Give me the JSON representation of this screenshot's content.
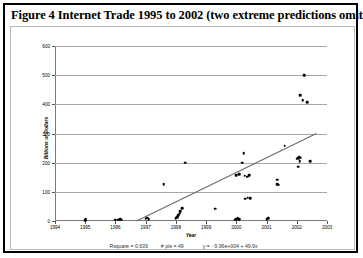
{
  "figure": {
    "title": "Figure 4 Internet Trade 1995 to 2002 (two extreme predictions omitted)"
  },
  "stats": {
    "rsquare_label": "Rsquare = 0.639",
    "npts_label": "# pts = 49",
    "equation_label": "y = - 9.96e+004 + 49.9x"
  },
  "chart_data": {
    "type": "scatter",
    "title": "Figure 4 Internet Trade 1995 to 2002 (two extreme predictions omitted)",
    "xlabel": "Year",
    "ylabel": "Billions of Dollars",
    "xlim": [
      1994,
      2003
    ],
    "ylim": [
      0,
      600
    ],
    "xticks": [
      1994,
      1995,
      1996,
      1997,
      1998,
      1999,
      2000,
      2001,
      2002,
      2003
    ],
    "xtick_labels": [
      "1994",
      "1995",
      "1996",
      "1997",
      "1998",
      "1999",
      "2000",
      "2001",
      "2002",
      "2003"
    ],
    "yticks": [
      0,
      100,
      200,
      300,
      400,
      500,
      600
    ],
    "ytick_labels": [
      "0",
      "100",
      "200",
      "300",
      "400",
      "500",
      "600"
    ],
    "grid": "horizontal",
    "legend": "none",
    "regression": {
      "rsquare": 0.639,
      "n_points": 49,
      "intercept": -99600,
      "slope": 49.9,
      "equation": "y = - 9.96e+004 + 49.9x",
      "line_x": [
        1996.7,
        2002.65
      ],
      "line_y": [
        0,
        300
      ]
    },
    "points": [
      {
        "x": 1995.0,
        "y": 3
      },
      {
        "x": 1995.02,
        "y": 6
      },
      {
        "x": 1996.0,
        "y": 4
      },
      {
        "x": 1996.1,
        "y": 5
      },
      {
        "x": 1996.15,
        "y": 7
      },
      {
        "x": 1996.2,
        "y": 4
      },
      {
        "x": 1997.0,
        "y": 8
      },
      {
        "x": 1997.05,
        "y": 12
      },
      {
        "x": 1997.1,
        "y": 6
      },
      {
        "x": 1997.6,
        "y": 126
      },
      {
        "x": 1998.0,
        "y": 9
      },
      {
        "x": 1998.05,
        "y": 14
      },
      {
        "x": 1998.08,
        "y": 20
      },
      {
        "x": 1998.12,
        "y": 26
      },
      {
        "x": 1998.15,
        "y": 33
      },
      {
        "x": 1998.2,
        "y": 43
      },
      {
        "x": 1998.3,
        "y": 200
      },
      {
        "x": 1999.3,
        "y": 42
      },
      {
        "x": 1999.95,
        "y": 5
      },
      {
        "x": 2000.0,
        "y": 7
      },
      {
        "x": 2000.05,
        "y": 10
      },
      {
        "x": 2000.1,
        "y": 6
      },
      {
        "x": 2000.3,
        "y": 76
      },
      {
        "x": 2000.38,
        "y": 80
      },
      {
        "x": 2000.45,
        "y": 78
      },
      {
        "x": 2000.0,
        "y": 158
      },
      {
        "x": 2000.1,
        "y": 161
      },
      {
        "x": 2000.28,
        "y": 155
      },
      {
        "x": 2000.35,
        "y": 152
      },
      {
        "x": 2000.42,
        "y": 158
      },
      {
        "x": 2000.2,
        "y": 200
      },
      {
        "x": 2000.25,
        "y": 232
      },
      {
        "x": 2001.35,
        "y": 142
      },
      {
        "x": 2001.35,
        "y": 126
      },
      {
        "x": 2001.38,
        "y": 124
      },
      {
        "x": 2001.6,
        "y": 258
      },
      {
        "x": 2002.0,
        "y": 214
      },
      {
        "x": 2002.05,
        "y": 215
      },
      {
        "x": 2002.08,
        "y": 219
      },
      {
        "x": 2002.12,
        "y": 217
      },
      {
        "x": 2002.1,
        "y": 206
      },
      {
        "x": 2002.05,
        "y": 186
      },
      {
        "x": 2002.2,
        "y": 415
      },
      {
        "x": 2002.35,
        "y": 408
      },
      {
        "x": 2002.12,
        "y": 432
      },
      {
        "x": 2002.25,
        "y": 500
      },
      {
        "x": 2002.45,
        "y": 205
      },
      {
        "x": 2001.0,
        "y": 6
      },
      {
        "x": 2001.05,
        "y": 9
      }
    ]
  }
}
